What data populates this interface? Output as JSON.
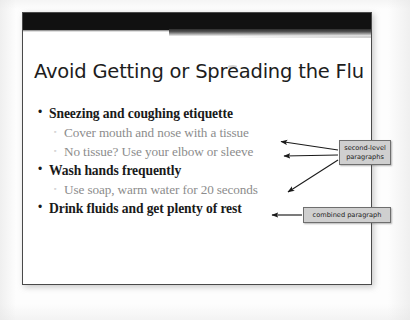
{
  "slide": {
    "title": "Avoid Getting or Spreading the Flu",
    "bullets": [
      {
        "level": 1,
        "marker": "•",
        "text": "Sneezing and coughing etiquette"
      },
      {
        "level": 2,
        "marker": "▫",
        "text": "Cover mouth and nose with a tissue"
      },
      {
        "level": 2,
        "marker": "▫",
        "text": "No tissue?  Use your elbow or sleeve"
      },
      {
        "level": 1,
        "marker": "•",
        "text": "Wash hands frequently"
      },
      {
        "level": 2,
        "marker": "▫",
        "text": "Use soap, warm water for 20 seconds"
      },
      {
        "level": 1,
        "marker": "•",
        "text": "Drink fluids and get plenty of rest"
      }
    ]
  },
  "annotations": {
    "second_level": "second-level paragraphs",
    "combined": "combined paragraph"
  },
  "colors": {
    "slide_background": "#ffffff",
    "slide_border": "#4a4a4a",
    "header_bar": "#111111",
    "title_text": "#1d1d1d",
    "level1_text": "#1a1a1a",
    "level2_text": "#8c8c8c",
    "callout_fill": "#cfcfcf",
    "callout_border": "#6e6e6e",
    "arrow": "#1a1a1a"
  }
}
